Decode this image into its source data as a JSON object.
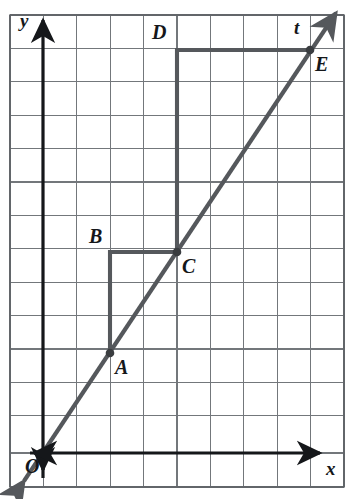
{
  "figure": {
    "kind": "coordinate-grid-diagram",
    "canvas": {
      "width": 347,
      "height": 499
    },
    "colors": {
      "background": "#ffffff",
      "grid_line": "#6e7276",
      "grid_border": "#5c6064",
      "axis": "#15171a",
      "line_t": "#55585c",
      "triangle_leg": "#55585c",
      "point_dot": "#3a3d40",
      "label_text": "#15171a"
    },
    "grid": {
      "origin_px": {
        "x": 43,
        "y": 453
      },
      "cell_px": 33.4,
      "cols": 10,
      "rows": 14,
      "left_px": 10,
      "top_px": 15,
      "right_px": 344,
      "bottom_px": 487,
      "show_border": true
    },
    "axes": [
      {
        "name": "x-axis",
        "label": "x",
        "label_px": {
          "x": 328,
          "y": 462
        },
        "arrow": "right"
      },
      {
        "name": "y-axis",
        "label": "y",
        "label_px": {
          "x": 21,
          "y": 13
        },
        "arrow": "up"
      }
    ],
    "line": {
      "name": "t",
      "label": "t",
      "label_px": {
        "x": 295,
        "y": 20
      },
      "slope": "3/2",
      "passes_through_origin": true,
      "arrows": "both"
    },
    "points": [
      {
        "id": "A",
        "label": "A",
        "grid": {
          "x": 2,
          "y": 3
        },
        "px": {
          "x": 110,
          "y": 353
        },
        "label_px": {
          "x": 116,
          "y": 358
        },
        "dot": true
      },
      {
        "id": "B",
        "label": "B",
        "grid": {
          "x": 2,
          "y": 6
        },
        "px": {
          "x": 110,
          "y": 252
        },
        "label_px": {
          "x": 90,
          "y": 228
        },
        "dot": false
      },
      {
        "id": "C",
        "label": "C",
        "grid": {
          "x": 4,
          "y": 6
        },
        "px": {
          "x": 177,
          "y": 252
        },
        "label_px": {
          "x": 183,
          "y": 257
        },
        "dot": true
      },
      {
        "id": "D",
        "label": "D",
        "grid": {
          "x": 4,
          "y": 12
        },
        "px": {
          "x": 177,
          "y": 50
        },
        "label_px": {
          "x": 152,
          "y": 24
        },
        "dot": false
      },
      {
        "id": "E",
        "label": "E",
        "grid": {
          "x": 8,
          "y": 12
        },
        "px": {
          "x": 310,
          "y": 50
        },
        "label_px": {
          "x": 316,
          "y": 56
        },
        "dot": true
      },
      {
        "id": "O",
        "label": "O",
        "grid": {
          "x": 0,
          "y": 0
        },
        "px": {
          "x": 43,
          "y": 453
        },
        "label_px": {
          "x": 26,
          "y": 458
        },
        "dot": false
      }
    ],
    "slope_triangles": [
      {
        "name": "triangle-ABC",
        "vertices": [
          "A",
          "B",
          "C"
        ],
        "rise": 3,
        "run": 2
      },
      {
        "name": "triangle-CDE",
        "vertices": [
          "C",
          "D",
          "E"
        ],
        "rise": 6,
        "run": 4
      }
    ]
  }
}
